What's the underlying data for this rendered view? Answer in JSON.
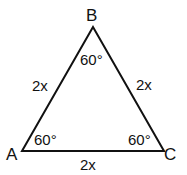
{
  "diagram": {
    "type": "equilateral-triangle",
    "vertices": {
      "A": "A",
      "B": "B",
      "C": "C"
    },
    "sides": {
      "AB": "2x",
      "BC": "2x",
      "AC": "2x"
    },
    "angles": {
      "A": "60°",
      "B": "60°",
      "C": "60°"
    }
  }
}
